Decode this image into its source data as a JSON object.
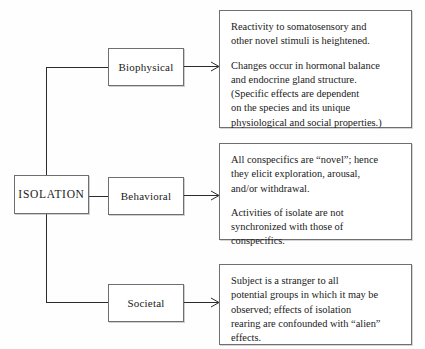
{
  "diagram": {
    "title": "Effects of Isolation Rearing",
    "root": {
      "label": "ISOLATION"
    },
    "branches": [
      {
        "key": "biophysical",
        "label": "Biophysical",
        "outcome": [
          "Reactivity to somatosensory and\nother novel stimuli is heightened.",
          "Changes occur in hormonal balance\nand endocrine gland structure.\n(Specific effects are dependent\non the species and its unique\nphysiological and social properties.)"
        ]
      },
      {
        "key": "behavioral",
        "label": "Behavioral",
        "outcome": [
          "All conspecifics are “novel”; hence\nthey elicit exploration, arousal,\nand/or withdrawal.",
          "Activities of isolate are not\nsynchronized with those of\nconspecifics."
        ]
      },
      {
        "key": "societal",
        "label": "Societal",
        "outcome": [
          "Subject is a stranger to all\npotential groups in which it may be\nobserved; effects of isolation\nrearing are confounded with “alien”\neffects."
        ]
      }
    ],
    "colors": {
      "box_border": "#6f6f70",
      "connector": "#2b2b2b",
      "text": "#1a1a1a",
      "background": "#fefefe"
    }
  }
}
